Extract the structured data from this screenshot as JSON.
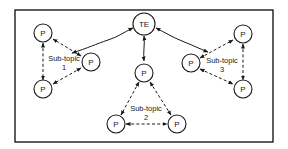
{
  "diagram": {
    "center_node": {
      "label": "TE"
    },
    "participant_label": "P",
    "subtopics": [
      {
        "line1": "Sub-topic",
        "line2": "1"
      },
      {
        "line1": "Sub-topic",
        "line2": "2"
      },
      {
        "line1": "Sub-topic",
        "line2": "3"
      }
    ],
    "nodes": [
      {
        "id": "te",
        "label": "TE"
      },
      {
        "id": "p-st1-top",
        "label": "P"
      },
      {
        "id": "p-st1-bottom",
        "label": "P"
      },
      {
        "id": "p-st1-hub",
        "label": "P"
      },
      {
        "id": "p-st2-hub",
        "label": "P"
      },
      {
        "id": "p-st2-left",
        "label": "P"
      },
      {
        "id": "p-st2-right",
        "label": "P"
      },
      {
        "id": "p-st3-hub",
        "label": "P"
      },
      {
        "id": "p-st3-top",
        "label": "P"
      },
      {
        "id": "p-st3-bottom",
        "label": "P"
      }
    ],
    "edges": [
      {
        "from": "te",
        "to": "p-st1-hub",
        "style": "solid",
        "arrows": "both"
      },
      {
        "from": "te",
        "to": "p-st2-hub",
        "style": "solid",
        "arrows": "both"
      },
      {
        "from": "te",
        "to": "p-st3-hub",
        "style": "solid",
        "arrows": "both"
      },
      {
        "from": "p-st1-hub",
        "to": "p-st1-top",
        "style": "dashed",
        "arrows": "both"
      },
      {
        "from": "p-st1-hub",
        "to": "p-st1-bottom",
        "style": "dashed",
        "arrows": "both"
      },
      {
        "from": "p-st1-top",
        "to": "p-st1-bottom",
        "style": "dashed",
        "arrows": "both"
      },
      {
        "from": "p-st2-hub",
        "to": "p-st2-left",
        "style": "dashed",
        "arrows": "both"
      },
      {
        "from": "p-st2-hub",
        "to": "p-st2-right",
        "style": "dashed",
        "arrows": "both"
      },
      {
        "from": "p-st2-left",
        "to": "p-st2-right",
        "style": "dashed",
        "arrows": "both"
      },
      {
        "from": "p-st3-hub",
        "to": "p-st3-top",
        "style": "dashed",
        "arrows": "both"
      },
      {
        "from": "p-st3-hub",
        "to": "p-st3-bottom",
        "style": "dashed",
        "arrows": "both"
      },
      {
        "from": "p-st3-top",
        "to": "p-st3-bottom",
        "style": "dashed",
        "arrows": "both"
      }
    ]
  }
}
